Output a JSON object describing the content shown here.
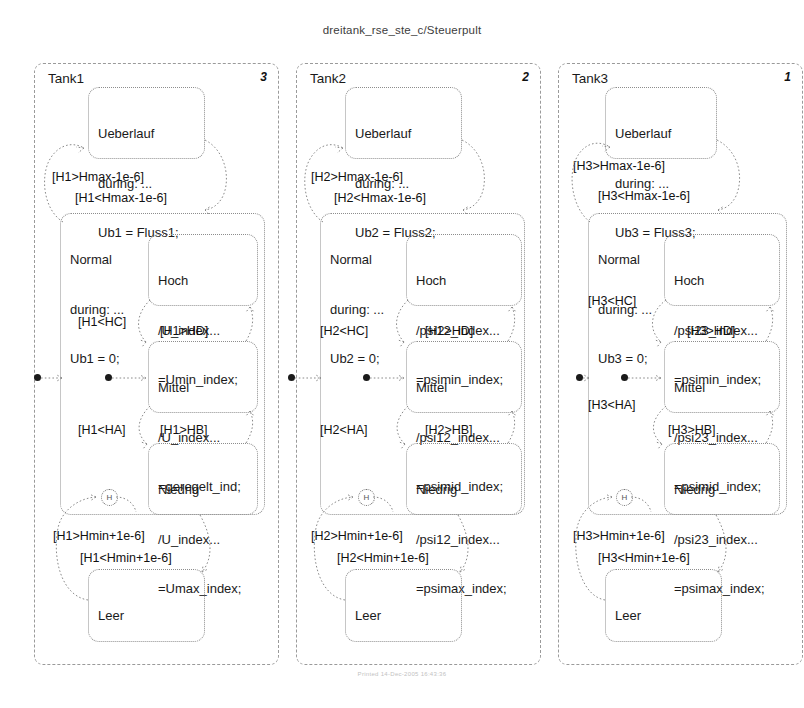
{
  "chart": {
    "title": "dreitank_rse_ste_c/Steuerpult",
    "footer_stamp": "Printed 14-Dec-2005 16:43:36"
  },
  "icons": {
    "history_junction": "history-junction-icon",
    "default_transition": "default-transition-dot-icon"
  },
  "tanks": [
    {
      "name": "Tank1",
      "order": "3",
      "overflow": {
        "name": "Ueberlauf",
        "during": "during: ...",
        "action": "Ub1 = Fluss1;"
      },
      "normal": {
        "name": "Normal",
        "during": "during: ...",
        "action": "Ub1 = 0;"
      },
      "empty": {
        "name": "Leer"
      },
      "substates": [
        {
          "name": "Hoch",
          "line1": "/U_index...",
          "line2": "=Umin_index;"
        },
        {
          "name": "Mittel",
          "line1": "/U_index...",
          "line2": "=geregelt_ind;"
        },
        {
          "name": "Niedrig",
          "line1": "/U_index...",
          "line2": "=Umax_index;"
        }
      ],
      "transitions": {
        "to_overflow": "[H1>Hmax-1e-6]",
        "from_overflow": "[H1<Hmax-1e-6]",
        "hoch_to_mittel": "[H1<HC]",
        "mittel_to_hoch": "[H1>HD]",
        "mittel_to_niedrig": "[H1<HA]",
        "niedrig_to_mittel": "[H1>HB]",
        "from_empty": "[H1>Hmin+1e-6]",
        "to_empty": "[H1<Hmin+1e-6]"
      }
    },
    {
      "name": "Tank2",
      "order": "2",
      "overflow": {
        "name": "Ueberlauf",
        "during": "during: ...",
        "action": "Ub2 = Fluss2;"
      },
      "normal": {
        "name": "Normal",
        "during": "during: ...",
        "action": "Ub2 = 0;"
      },
      "empty": {
        "name": "Leer"
      },
      "substates": [
        {
          "name": "Hoch",
          "line1": "/psi12_index...",
          "line2": "=psimin_index;"
        },
        {
          "name": "Mittel",
          "line1": "/psi12_index...",
          "line2": "=psimid_index;"
        },
        {
          "name": "Niedrig",
          "line1": "/psi12_index...",
          "line2": "=psimax_index;"
        }
      ],
      "transitions": {
        "to_overflow": "[H2>Hmax-1e-6]",
        "from_overflow": "[H2<Hmax-1e-6]",
        "hoch_to_mittel": "[H2<HC]",
        "mittel_to_hoch": "[H2>HD]",
        "mittel_to_niedrig": "[H2<HA]",
        "niedrig_to_mittel": "[H2>HB]",
        "from_empty": "[H2>Hmin+1e-6]",
        "to_empty": "[H2<Hmin+1e-6]"
      }
    },
    {
      "name": "Tank3",
      "order": "1",
      "overflow": {
        "name": "Ueberlauf",
        "during": "during: ...",
        "action": "Ub3 = Fluss3;"
      },
      "normal": {
        "name": "Normal",
        "during": "during: ...",
        "action": "Ub3 = 0;"
      },
      "empty": {
        "name": "Leer"
      },
      "substates": [
        {
          "name": "Hoch",
          "line1": "/psi23_index...",
          "line2": "=psimin_index;"
        },
        {
          "name": "Mittel",
          "line1": "/psi23_index...",
          "line2": "=psimid_index;"
        },
        {
          "name": "Niedrig",
          "line1": "/psi23_index...",
          "line2": "=psimax_index;"
        }
      ],
      "transitions": {
        "to_overflow": "[H3>Hmax-1e-6]",
        "from_overflow": "[H3<Hmax-1e-6]",
        "hoch_to_mittel": "[H3<HC]",
        "mittel_to_hoch": "[H3>HD]",
        "mittel_to_niedrig": "[H3<HA]",
        "niedrig_to_mittel": "[H3>HB]",
        "from_empty": "[H3>Hmin+1e-6]",
        "to_empty": "[H3<Hmin+1e-6]"
      }
    }
  ]
}
